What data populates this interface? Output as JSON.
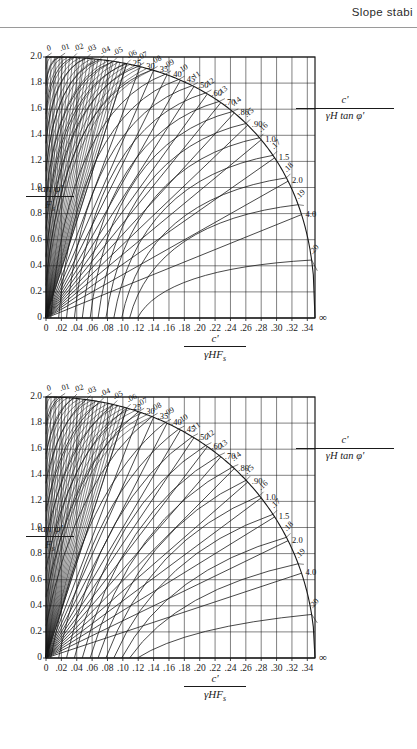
{
  "header": {
    "running_head": "Slope stabi"
  },
  "figures": [
    {
      "id": "chart-top",
      "chart_data": {
        "type": "line",
        "title": "",
        "xlabel": "c' / γHFₛ",
        "ylabel": "tan φ' / Fₛ",
        "xlim": [
          0,
          0.35
        ],
        "ylim": [
          0,
          2.0
        ],
        "grid": true,
        "legend_position": "right",
        "legend_label": "c' / γH tan φ'",
        "xticks": [
          "0",
          ".02",
          ".04",
          ".06",
          ".08",
          ".10",
          ".12",
          ".14",
          ".16",
          ".18",
          ".20",
          ".22",
          ".24",
          ".26",
          ".28",
          ".30",
          ".32",
          ".34"
        ],
        "xtick_values": [
          0,
          0.02,
          0.04,
          0.06,
          0.08,
          0.1,
          0.12,
          0.14,
          0.16,
          0.18,
          0.2,
          0.22,
          0.24,
          0.26,
          0.28,
          0.3,
          0.32,
          0.34
        ],
        "yticks": [
          "0",
          "0.2",
          "0.4",
          "0.6",
          "0.8",
          "1.0",
          "1.2",
          "1.4",
          "1.6",
          "1.8",
          "2.0"
        ],
        "ytick_values": [
          0,
          0.2,
          0.4,
          0.6,
          0.8,
          1.0,
          1.2,
          1.4,
          1.6,
          1.8,
          2.0
        ],
        "arc_labels": [
          "0",
          ".01",
          ".02",
          ".03",
          ".04",
          ".05",
          ".06",
          ".07",
          ".08",
          ".09",
          ".10",
          ".11",
          ".12",
          ".13",
          ".14",
          ".15",
          ".16",
          ".17",
          ".18",
          ".19",
          ".20"
        ],
        "arc_label_values": [
          0,
          0.01,
          0.02,
          0.03,
          0.04,
          0.05,
          0.06,
          0.07,
          0.08,
          0.09,
          0.1,
          0.11,
          0.12,
          0.13,
          0.14,
          0.15,
          0.16,
          0.17,
          0.18,
          0.19,
          0.2
        ],
        "radial_labels": [
          ".25",
          ".30",
          ".35",
          ".40",
          ".45",
          ".50",
          ".60",
          ".70",
          ".80",
          ".90",
          "1.0",
          "1.5",
          "2.0",
          "4.0",
          "∞"
        ],
        "radial_label_values": [
          0.25,
          0.3,
          0.35,
          0.4,
          0.45,
          0.5,
          0.6,
          0.7,
          0.8,
          0.9,
          1.0,
          1.5,
          2.0,
          4.0,
          99
        ]
      }
    },
    {
      "id": "chart-bottom",
      "chart_data": {
        "type": "line",
        "title": "",
        "xlabel": "c' / γHFₛ",
        "ylabel": "tan φ' / Fₛ",
        "xlim": [
          0,
          0.35
        ],
        "ylim": [
          0,
          2.0
        ],
        "grid": true,
        "legend_position": "right",
        "legend_label": "c' / γH tan φ'",
        "xticks": [
          "0",
          ".02",
          ".04",
          ".06",
          ".08",
          ".10",
          ".12",
          ".14",
          ".16",
          ".18",
          ".20",
          ".22",
          ".24",
          ".26",
          ".28",
          ".30",
          ".32",
          ".34"
        ],
        "xtick_values": [
          0,
          0.02,
          0.04,
          0.06,
          0.08,
          0.1,
          0.12,
          0.14,
          0.16,
          0.18,
          0.2,
          0.22,
          0.24,
          0.26,
          0.28,
          0.3,
          0.32,
          0.34
        ],
        "yticks": [
          "0",
          "0.2",
          "0.4",
          "0.6",
          "0.8",
          "1.0",
          "1.2",
          "1.4",
          "1.6",
          "1.8",
          "2.0"
        ],
        "ytick_values": [
          0,
          0.2,
          0.4,
          0.6,
          0.8,
          1.0,
          1.2,
          1.4,
          1.6,
          1.8,
          2.0
        ],
        "arc_labels": [
          "0",
          ".01",
          ".02",
          ".03",
          ".04",
          ".05",
          ".06",
          ".07",
          ".08",
          ".09",
          ".10",
          ".11",
          ".12",
          ".13",
          ".14",
          ".15",
          ".16",
          ".17",
          ".18",
          ".19",
          ".20"
        ],
        "arc_label_values": [
          0,
          0.01,
          0.02,
          0.03,
          0.04,
          0.05,
          0.06,
          0.07,
          0.08,
          0.09,
          0.1,
          0.11,
          0.12,
          0.13,
          0.14,
          0.15,
          0.16,
          0.17,
          0.18,
          0.19,
          0.2
        ],
        "radial_labels": [
          ".25",
          ".30",
          ".35",
          ".40",
          ".45",
          ".50",
          ".60",
          ".70",
          ".80",
          ".90",
          "1.0",
          "1.5",
          "2.0",
          "4.0",
          "∞"
        ],
        "radial_label_values": [
          0.25,
          0.3,
          0.35,
          0.4,
          0.45,
          0.5,
          0.6,
          0.7,
          0.8,
          0.9,
          1.0,
          1.5,
          2.0,
          4.0,
          99
        ]
      }
    }
  ],
  "axis_titles": {
    "x_numerator": "c'",
    "x_denominator_gamma": "γHF",
    "x_denominator_sub": "s",
    "y_numerator_tan": "tan",
    "y_numerator_phi": "φ'",
    "y_denominator": "F",
    "y_denominator_sub": "s",
    "legend_numerator": "c'",
    "legend_denominator_gamma": "γH",
    "legend_denominator_tan": "tan",
    "legend_denominator_phi": "φ'"
  },
  "colors": {
    "ink": "#1a1a1a",
    "rule": "#9a9a9a",
    "paper": "#ffffff"
  }
}
